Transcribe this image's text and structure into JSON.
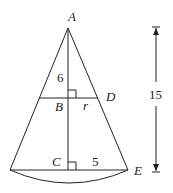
{
  "diagram": {
    "labels": {
      "apex": "A",
      "mid_center": "B",
      "mid_edge": "D",
      "base_center": "C",
      "base_edge": "E",
      "small_radius": "r",
      "upper_height": "6",
      "base_radius": "5",
      "total_height": "15"
    },
    "colors": {
      "stroke": "#222222",
      "background": "#ffffff"
    }
  }
}
